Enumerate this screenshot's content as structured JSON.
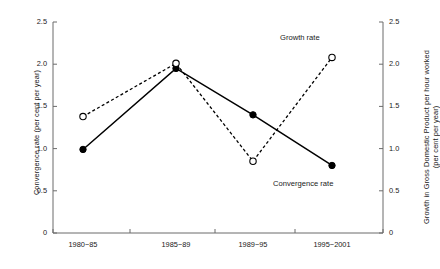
{
  "chart_data": {
    "type": "line",
    "title": "",
    "xlabel": "",
    "ylabel": "Convergence rate (per cent per year)",
    "y2label_line1": "Growth in Gross Domestic  Product per hour worked",
    "y2label_line2": "(per cent per year)",
    "categories": [
      "1980−85",
      "1985−89",
      "1989−95",
      "1995−2001"
    ],
    "ylim": [
      0,
      2.5
    ],
    "y2lim": [
      0,
      2.5
    ],
    "yticks": [
      "0",
      "0.5",
      "1.0",
      "1.5",
      "2.0",
      "2.5"
    ],
    "ytick_values": [
      0,
      0.5,
      1.0,
      1.5,
      2.0,
      2.5
    ],
    "y2ticks": [
      "0",
      "0.5",
      "1.0",
      "1.5",
      "2.0",
      "2.5"
    ],
    "y2tick_values": [
      0,
      0.5,
      1.0,
      1.5,
      2.0,
      2.5
    ],
    "grid": false,
    "legend_position": "inline-annotations",
    "series": [
      {
        "name": "Convergence rate",
        "axis": "left",
        "line_style": "solid",
        "marker": "filled-circle",
        "color": "#000000",
        "values": [
          0.99,
          1.95,
          1.4,
          0.8
        ]
      },
      {
        "name": "Growth rate",
        "axis": "right",
        "line_style": "dashed",
        "marker": "open-circle",
        "color": "#000000",
        "values": [
          1.38,
          2.01,
          0.85,
          2.08
        ]
      }
    ],
    "annotations": [
      {
        "text": "Growth rate",
        "series": "Growth rate"
      },
      {
        "text": "Convergence rate",
        "series": "Convergence rate"
      }
    ]
  }
}
